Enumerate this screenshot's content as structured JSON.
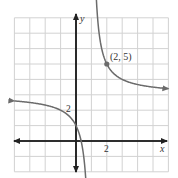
{
  "chart_data": {
    "type": "line",
    "title": "",
    "xlabel": "x",
    "ylabel": "y",
    "xlim": [
      -4,
      6
    ],
    "ylim": [
      -2,
      8
    ],
    "grid": true,
    "grid_unit": 1,
    "tick_labels": {
      "x": [
        "2"
      ],
      "y": [
        "2"
      ]
    },
    "function": "y = 3 + 2/(x - 1)",
    "asymptotes": {
      "vertical": 1,
      "horizontal": 3
    },
    "annotations": [
      {
        "label": "(2, 5)",
        "x": 2,
        "y": 5
      }
    ],
    "series": [
      {
        "name": "left branch",
        "x": [
          -4,
          -3,
          -2,
          -1,
          0,
          0.5,
          0.67
        ],
        "y": [
          2.6,
          2.5,
          2.33,
          2,
          1,
          -1,
          -3
        ]
      },
      {
        "name": "right branch",
        "x": [
          1.29,
          1.5,
          2,
          3,
          4,
          5,
          6
        ],
        "y": [
          10,
          7,
          5,
          4,
          3.67,
          3.5,
          3.4
        ]
      }
    ],
    "colors": {
      "curve": "#6b6b6b",
      "axes": "#222222",
      "grid": "#cfcfcf",
      "point": "#6b6b6b"
    }
  },
  "labels": {
    "x_axis": "x",
    "y_axis": "y",
    "x_tick": "2",
    "y_tick": "2",
    "point": "(2, 5)"
  }
}
